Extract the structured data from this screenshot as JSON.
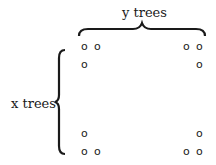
{
  "labels": {
    "top": "y trees",
    "left": "x trees"
  },
  "tree_marker": "o",
  "grid": {
    "rows": [
      {
        "left": [
          "o",
          "o"
        ],
        "right": [
          "o",
          "o"
        ]
      },
      {
        "left": [
          "o"
        ],
        "right": [
          "o"
        ]
      },
      {
        "left": [
          "o"
        ],
        "right": [
          "o"
        ]
      },
      {
        "left": [
          "o",
          "o"
        ],
        "right": [
          "o",
          "o"
        ]
      }
    ]
  }
}
